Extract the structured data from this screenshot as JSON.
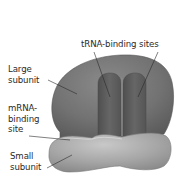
{
  "figure": {
    "colors": {
      "background": "#ffffff",
      "large_subunit": "#6e6e6e",
      "large_subunit_highlight": "#8a8a8a",
      "trna_groove": "#5c5c5c",
      "small_subunit": "#a3a3a3",
      "small_subunit_highlight": "#c4c4c4",
      "leader_line": "#2a2a2a",
      "label_text": "#2a2a2a"
    },
    "labels": {
      "trna_sites": {
        "line1": "tRNA-binding sites"
      },
      "large_subunit": {
        "line1": "Large",
        "line2": "subunit"
      },
      "mrna_site": {
        "line1": "mRNA-",
        "line2": "binding",
        "line3": "site"
      },
      "small_subunit": {
        "line1": "Small",
        "line2": "subunit"
      }
    }
  }
}
